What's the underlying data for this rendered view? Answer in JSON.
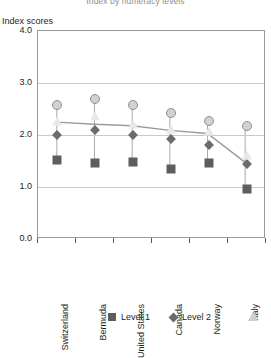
{
  "chart_data": {
    "type": "scatter",
    "title": "Index by numeracy levels",
    "ylabel": "Index scores",
    "xlabel": "",
    "ylim": [
      0.0,
      4.0
    ],
    "yticks": [
      "4.0",
      "3.0",
      "2.0",
      "1.0",
      "0.0"
    ],
    "ytick_values": [
      4.0,
      3.0,
      2.0,
      1.0,
      0.0
    ],
    "grid": true,
    "legend_position": "bottom",
    "categories": [
      "Switzerland",
      "Bermuda",
      "United States",
      "Canada",
      "Norway",
      "Italy"
    ],
    "series": [
      {
        "name": "Level 1",
        "marker": "square",
        "color": "#5e5e5e",
        "connected": true,
        "values": [
          1.52,
          1.46,
          1.48,
          1.35,
          1.47,
          0.96
        ]
      },
      {
        "name": "Level 2",
        "marker": "diamond",
        "color": "#6b6b6b",
        "connected": false,
        "values": [
          2.0,
          2.09,
          2.0,
          1.92,
          1.81,
          1.45
        ]
      },
      {
        "name": "Level 3",
        "marker": "triangle",
        "color": "#e8e8e8",
        "connected": false,
        "values": [
          2.26,
          2.36,
          2.22,
          2.12,
          2.07,
          1.62
        ]
      },
      {
        "name": "Level 4/5",
        "marker": "circle",
        "color": "#d2d2d2",
        "connected": false,
        "values": [
          2.57,
          2.7,
          2.57,
          2.43,
          2.27,
          2.18
        ]
      }
    ],
    "trend_line": {
      "name": "Level 1 trend",
      "values": [
        2.23,
        2.19,
        2.16,
        2.07,
        2.01,
        1.45
      ]
    }
  },
  "legend": {
    "items": [
      {
        "label": "Level 1",
        "marker": "square"
      },
      {
        "label": "Level 2",
        "marker": "diamond"
      },
      {
        "label": "",
        "marker": "triangle"
      }
    ]
  }
}
